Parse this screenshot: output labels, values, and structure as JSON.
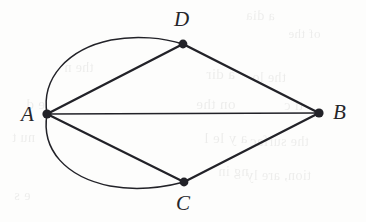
{
  "figure": {
    "kind": "undirected-multigraph-diagram",
    "background_color": "#fdfdfc",
    "ink_color": "#222228",
    "canvas": {
      "width": 366,
      "height": 222
    }
  },
  "vertices": [
    {
      "id": "A",
      "label": "A",
      "x": 47,
      "y": 114,
      "dot_radius": 4.6,
      "label_x": 21,
      "label_y": 104,
      "label_anchor": "left"
    },
    {
      "id": "B",
      "label": "B",
      "x": 319,
      "y": 113,
      "dot_radius": 4.6,
      "label_x": 333,
      "label_y": 102,
      "label_anchor": "right"
    },
    {
      "id": "C",
      "label": "C",
      "x": 184,
      "y": 182,
      "dot_radius": 4.4,
      "label_x": 176,
      "label_y": 193,
      "label_anchor": "below"
    },
    {
      "id": "D",
      "label": "D",
      "x": 183,
      "y": 44,
      "dot_radius": 4.4,
      "label_x": 174,
      "label_y": 9,
      "label_anchor": "above"
    }
  ],
  "edges": [
    {
      "id": "A-B",
      "from": "A",
      "to": "B",
      "shape": "straight",
      "width": 1.3,
      "d": "M 47 114 L 319 113"
    },
    {
      "id": "A-D-line",
      "from": "A",
      "to": "D",
      "shape": "straight",
      "width": 2.4,
      "d": "M 47 114 L 183 44"
    },
    {
      "id": "A-D-curve",
      "from": "A",
      "to": "D",
      "shape": "curved",
      "width": 1.5,
      "d": "M 47 114 C 41 78 68 49 111 40 C 137 35 164 38 183 44",
      "bulge": "upper-left"
    },
    {
      "id": "A-C-line",
      "from": "A",
      "to": "C",
      "shape": "straight",
      "width": 2.2,
      "d": "M 47 114 L 184 182"
    },
    {
      "id": "A-C-curve",
      "from": "A",
      "to": "C",
      "shape": "curved",
      "width": 1.5,
      "d": "M 47 114 C 41 150 66 177 110 186 C 137 191 165 187 184 182",
      "bulge": "lower-left"
    },
    {
      "id": "D-B",
      "from": "D",
      "to": "B",
      "shape": "straight",
      "width": 2.5,
      "d": "M 183 44 L 319 113"
    },
    {
      "id": "C-B",
      "from": "C",
      "to": "B",
      "shape": "straight",
      "width": 2.3,
      "d": "M 184 182 L 319 113"
    }
  ],
  "bleed_text": [
    {
      "text": "a dia",
      "x": 246,
      "y": 8,
      "size": 14,
      "rot": -1
    },
    {
      "text": "of the",
      "x": 288,
      "y": 26,
      "size": 13,
      "rot": 0
    },
    {
      "text": "the n",
      "x": 64,
      "y": 60,
      "size": 14,
      "rot": 0
    },
    {
      "text": "a dir",
      "x": 206,
      "y": 66,
      "size": 15,
      "rot": 0
    },
    {
      "text": "the lo",
      "x": 252,
      "y": 70,
      "size": 14,
      "rot": 0
    },
    {
      "text": "e d",
      "x": 26,
      "y": 96,
      "size": 15,
      "rot": 0
    },
    {
      "text": "on the",
      "x": 196,
      "y": 96,
      "size": 15,
      "rot": 0
    },
    {
      "text": "ti c",
      "x": 284,
      "y": 98,
      "size": 14,
      "rot": 0
    },
    {
      "text": "nu t",
      "x": 12,
      "y": 130,
      "size": 14,
      "rot": 0
    },
    {
      "text": "a y le l",
      "x": 204,
      "y": 130,
      "size": 15,
      "rot": 0
    },
    {
      "text": "the surfac",
      "x": 250,
      "y": 134,
      "size": 14,
      "rot": 0
    },
    {
      "text": "ng in",
      "x": 218,
      "y": 164,
      "size": 14,
      "rot": 0
    },
    {
      "text": "tion, are ly",
      "x": 246,
      "y": 168,
      "size": 14,
      "rot": 0
    },
    {
      "text": "e s",
      "x": 14,
      "y": 188,
      "size": 14,
      "rot": 0
    }
  ]
}
